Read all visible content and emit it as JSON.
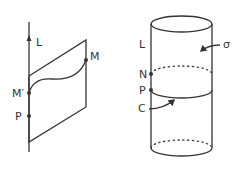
{
  "figure_left": {
    "line_label": "L",
    "point_m_label": "M",
    "point_mprime_label": "M′",
    "point_p_label": "P"
  },
  "figure_right": {
    "line_label": "L",
    "surface_label": "σ",
    "point_n_label": "N",
    "point_p_label": "P",
    "curve_label": "C"
  },
  "colors": {
    "ink": "#333333",
    "background": "#ffffff"
  }
}
